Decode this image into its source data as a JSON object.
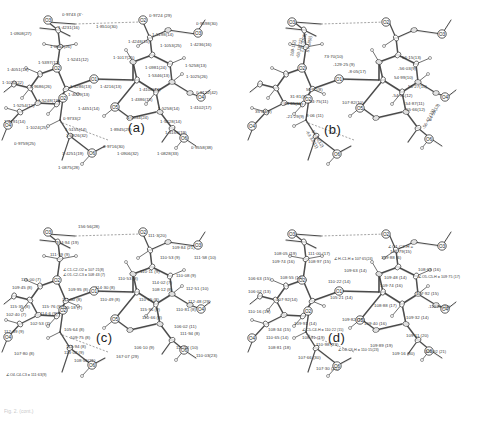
{
  "figure": {
    "type": "crystallographic-ortep-panels",
    "panel_count": 4,
    "background_color": "#ffffff",
    "line_color": "#2b2b2b",
    "caption_fragment": "Fig. 2. (cont.)"
  },
  "panels": [
    {
      "id": "a",
      "letter": "(a)",
      "quantity": "bond lengths",
      "units": "angstrom",
      "labels": [
        {
          "text": "0·9743 (3'·",
          "x": 62,
          "y": 13
        },
        {
          "text": "1·4231(16)",
          "x": 58,
          "y": 26
        },
        {
          "text": "1·8510(30)",
          "x": 96,
          "y": 25
        },
        {
          "text": "0·9724 (29)",
          "x": 149,
          "y": 14
        },
        {
          "text": "0·9598(30)",
          "x": 196,
          "y": 22
        },
        {
          "text": "1·0908(27)",
          "x": 10,
          "y": 32
        },
        {
          "text": "1·0952(26)",
          "x": 50,
          "y": 45
        },
        {
          "text": "1·5198(14)",
          "x": 152,
          "y": 33
        },
        {
          "text": "1·4248(15)",
          "x": 128,
          "y": 40
        },
        {
          "text": "1·1053(25)",
          "x": 160,
          "y": 44
        },
        {
          "text": "1·4236(16)",
          "x": 190,
          "y": 43
        },
        {
          "text": "1·5241(12)",
          "x": 67,
          "y": 58
        },
        {
          "text": "1·5397(12)",
          "x": 38,
          "y": 61
        },
        {
          "text": "1·1017(25)",
          "x": 113,
          "y": 56
        },
        {
          "text": "1·4051(14)",
          "x": 7,
          "y": 68
        },
        {
          "text": "1·0981(24)",
          "x": 145,
          "y": 66
        },
        {
          "text": "1·5258(13)",
          "x": 185,
          "y": 64
        },
        {
          "text": "1·4286(13)",
          "x": 70,
          "y": 85
        },
        {
          "text": "1·4216(13)",
          "x": 100,
          "y": 85
        },
        {
          "text": "1·5346(13)",
          "x": 148,
          "y": 74
        },
        {
          "text": "1·1025(26)",
          "x": 186,
          "y": 75
        },
        {
          "text": "1·1020(22)",
          "x": 2,
          "y": 81
        },
        {
          "text": "0·9686(26)",
          "x": 30,
          "y": 85
        },
        {
          "text": "1·4079(13)",
          "x": 68,
          "y": 93
        },
        {
          "text": "1·4108(14)",
          "x": 139,
          "y": 88
        },
        {
          "text": "0·9122(42)",
          "x": 196,
          "y": 91
        },
        {
          "text": "1·5248(13)",
          "x": 38,
          "y": 99
        },
        {
          "text": "1·4386(15)",
          "x": 131,
          "y": 98
        },
        {
          "text": "1·4451(14)",
          "x": 78,
          "y": 107
        },
        {
          "text": "1·5258(14)",
          "x": 158,
          "y": 107
        },
        {
          "text": "1·4102(17)",
          "x": 190,
          "y": 106
        },
        {
          "text": "1·5254(12)",
          "x": 13,
          "y": 104
        },
        {
          "text": "0·9733(2",
          "x": 63,
          "y": 117
        },
        {
          "text": "1·1034(24)",
          "x": 127,
          "y": 116
        },
        {
          "text": "1·5228(14)",
          "x": 160,
          "y": 120
        },
        {
          "text": "1·4191(14)",
          "x": 4,
          "y": 120
        },
        {
          "text": "1·1024(25)",
          "x": 26,
          "y": 126
        },
        {
          "text": "1·5155(14)",
          "x": 65,
          "y": 128
        },
        {
          "text": "1·0926(32)",
          "x": 66,
          "y": 134
        },
        {
          "text": "1·8945(29)",
          "x": 110,
          "y": 128
        },
        {
          "text": "1·4169(19)",
          "x": 165,
          "y": 131
        },
        {
          "text": "0·9759(25)",
          "x": 14,
          "y": 142
        },
        {
          "text": "0·9716(30)",
          "x": 103,
          "y": 145
        },
        {
          "text": "0·9558(38)",
          "x": 191,
          "y": 146
        },
        {
          "text": "1·4251(19)",
          "x": 62,
          "y": 152
        },
        {
          "text": "1·0906(32)",
          "x": 117,
          "y": 152
        },
        {
          "text": "1·0828(33)",
          "x": 157,
          "y": 152
        },
        {
          "text": "1·0875(28)",
          "x": 58,
          "y": 166
        }
      ]
    },
    {
      "id": "b",
      "letter": "(b)",
      "quantity": "torsion angles",
      "units": "degrees",
      "labels": [
        {
          "text": "73·70(10)",
          "x": 78,
          "y": 55
        },
        {
          "text": "-129·25 (9)",
          "x": 87,
          "y": 63
        },
        {
          "text": "-8·05(17)",
          "x": 102,
          "y": 70
        },
        {
          "text": "-56·03(9)",
          "x": 152,
          "y": 67
        },
        {
          "text": "56·15(13)",
          "x": 156,
          "y": 56
        },
        {
          "text": "54·99(10)",
          "x": 148,
          "y": 76
        },
        {
          "text": "56·27(10)",
          "x": 162,
          "y": 85
        },
        {
          "text": "59·81(8)",
          "x": 60,
          "y": 88
        },
        {
          "text": "-44·75(11)",
          "x": 62,
          "y": 100
        },
        {
          "text": "107·82(10)",
          "x": 96,
          "y": 101
        },
        {
          "text": "-54·91(12)",
          "x": 146,
          "y": 94
        },
        {
          "text": "-54·87(11)",
          "x": 158,
          "y": 102
        },
        {
          "text": "55·66(12)",
          "x": 160,
          "y": 108
        },
        {
          "text": "31·81(9)",
          "x": 44,
          "y": 95
        },
        {
          "text": "44·65(11)",
          "x": 38,
          "y": 102
        },
        {
          "text": "35·04(9)",
          "x": 9,
          "y": 110
        },
        {
          "text": "-21·29(9)",
          "x": 40,
          "y": 115
        },
        {
          "text": "8·06 (11)",
          "x": 60,
          "y": 114
        },
        {
          "text": "171·37(9)",
          "x": 54,
          "y": 52,
          "rot": -80
        },
        {
          "text": "57·18(8)",
          "x": 60,
          "y": 52,
          "rot": -80
        },
        {
          "text": "169·1(2)",
          "x": 44,
          "y": 56,
          "rot": -80
        },
        {
          "text": "-63·18(12)",
          "x": 50,
          "y": 58,
          "rot": -80
        },
        {
          "text": "64·59(13)",
          "x": 182,
          "y": 120,
          "rot": -62
        },
        {
          "text": "-56·42 (13)",
          "x": 176,
          "y": 128,
          "rot": -62
        },
        {
          "text": "-63·33(11)",
          "x": 62,
          "y": 130,
          "rot": 58
        },
        {
          "text": "57·14(12)",
          "x": 68,
          "y": 130,
          "rot": 58
        }
      ]
    },
    {
      "id": "c",
      "letter": "(c)",
      "quantity": "bond angles, heavy atoms",
      "units": "degrees",
      "labels": [
        {
          "text": "156·56(28)",
          "x": 78,
          "y": 13
        },
        {
          "text": "111·3(20)",
          "x": 148,
          "y": 22
        },
        {
          "text": "104·94 (19)",
          "x": 56,
          "y": 29
        },
        {
          "text": "109·84 (21)",
          "x": 172,
          "y": 34
        },
        {
          "text": "111·19 (9)",
          "x": 50,
          "y": 41
        },
        {
          "text": "110·53 (9)",
          "x": 160,
          "y": 44
        },
        {
          "text": "111·58 (10)",
          "x": 194,
          "y": 44
        },
        {
          "text": "∠C1-C2-O2 = 107·21(8)",
          "x": 63,
          "y": 57
        },
        {
          "text": "∠O1-C2-C3 = 108·43 (7)",
          "x": 63,
          "y": 62
        },
        {
          "text": "110·11 (9)",
          "x": 140,
          "y": 58
        },
        {
          "text": "110·53 (8)",
          "x": 118,
          "y": 65
        },
        {
          "text": "110·08 (9)",
          "x": 176,
          "y": 62
        },
        {
          "text": "114·02 (7)",
          "x": 152,
          "y": 69
        },
        {
          "text": "115·00 (7)",
          "x": 21,
          "y": 66
        },
        {
          "text": "109·45 (8)",
          "x": 12,
          "y": 74
        },
        {
          "text": "114·30 (8)",
          "x": 95,
          "y": 74
        },
        {
          "text": "109·95 (8)",
          "x": 68,
          "y": 76
        },
        {
          "text": "108·12 (8)",
          "x": 152,
          "y": 76
        },
        {
          "text": "112·51 (10)",
          "x": 186,
          "y": 75
        },
        {
          "text": "111·00 (8)",
          "x": 62,
          "y": 86
        },
        {
          "text": "110·49 (8)",
          "x": 100,
          "y": 86
        },
        {
          "text": "110·65 (8)",
          "x": 139,
          "y": 86
        },
        {
          "text": "105·18 (7)",
          "x": 62,
          "y": 94
        },
        {
          "text": "112·48 (29)",
          "x": 188,
          "y": 88
        },
        {
          "text": "115·35 (8)",
          "x": 10,
          "y": 93
        },
        {
          "text": "115·76 (9)",
          "x": 42,
          "y": 93
        },
        {
          "text": "115·96 (9)",
          "x": 140,
          "y": 96
        },
        {
          "text": "110·81 (8)",
          "x": 176,
          "y": 96
        },
        {
          "text": "114·6 (9)",
          "x": 40,
          "y": 100
        },
        {
          "text": "102·40 (7)",
          "x": 6,
          "y": 101
        },
        {
          "text": "110·66 (8)",
          "x": 142,
          "y": 104
        },
        {
          "text": "102·53 (7)",
          "x": 30,
          "y": 110
        },
        {
          "text": "105·64 (8)",
          "x": 64,
          "y": 116
        },
        {
          "text": "106·02 (11)",
          "x": 174,
          "y": 113
        },
        {
          "text": "112·39 (9)",
          "x": 4,
          "y": 118
        },
        {
          "text": "109·75 (8)",
          "x": 70,
          "y": 124
        },
        {
          "text": "111·94 (8)",
          "x": 180,
          "y": 120
        },
        {
          "text": "114·94 (8)",
          "x": 66,
          "y": 133
        },
        {
          "text": "113·02 (9)",
          "x": 64,
          "y": 139
        },
        {
          "text": "106·10 (9)",
          "x": 134,
          "y": 134
        },
        {
          "text": "111·52 (10)",
          "x": 176,
          "y": 134
        },
        {
          "text": "107·80 (8)",
          "x": 14,
          "y": 140
        },
        {
          "text": "167·07 (29)",
          "x": 116,
          "y": 143
        },
        {
          "text": "110·03(23)",
          "x": 196,
          "y": 142
        },
        {
          "text": "108·56(21)",
          "x": 74,
          "y": 147
        },
        {
          "text": "∠O4-C4-C3 = 111·63(9)",
          "x": 6,
          "y": 162
        }
      ]
    },
    {
      "id": "d",
      "letter": "(d)",
      "quantity": "bond angles involving H",
      "units": "degrees",
      "labels": [
        {
          "text": "∠C1-C2-H =",
          "x": 142,
          "y": 33
        },
        {
          "text": "106·79(15)",
          "x": 144,
          "y": 38
        },
        {
          "text": "108·05 (19)",
          "x": 28,
          "y": 40
        },
        {
          "text": "111·00 (17)",
          "x": 62,
          "y": 40
        },
        {
          "text": "109·88 (6)",
          "x": 135,
          "y": 44
        },
        {
          "text": "109·74 (16)",
          "x": 26,
          "y": 48
        },
        {
          "text": "108·97 (15)",
          "x": 62,
          "y": 48
        },
        {
          "text": "∠H-C1-H = 107·65(24)",
          "x": 88,
          "y": 46
        },
        {
          "text": "109·63 (14)",
          "x": 98,
          "y": 57
        },
        {
          "text": "108·63 (16)",
          "x": 172,
          "y": 56
        },
        {
          "text": "106·63 (15)",
          "x": 2,
          "y": 65
        },
        {
          "text": "108·55 (14)",
          "x": 34,
          "y": 64
        },
        {
          "text": "109·48 (14)",
          "x": 138,
          "y": 64
        },
        {
          "text": "∠O5-C5-H = 109·75 (17)",
          "x": 172,
          "y": 64
        },
        {
          "text": "110·22 (14)",
          "x": 82,
          "y": 68
        },
        {
          "text": "109·74 (16)",
          "x": 134,
          "y": 72
        },
        {
          "text": "106·02 (13)",
          "x": 2,
          "y": 78
        },
        {
          "text": "107·92 (15)",
          "x": 170,
          "y": 80
        },
        {
          "text": "105·21 (14)",
          "x": 84,
          "y": 84
        },
        {
          "text": "107·92(14)",
          "x": 30,
          "y": 86
        },
        {
          "text": "108·88 (17)",
          "x": 128,
          "y": 92
        },
        {
          "text": "-110·23 (18)",
          "x": 182,
          "y": 93
        },
        {
          "text": "110·16 (16)",
          "x": 2,
          "y": 98
        },
        {
          "text": "109·82 (17)",
          "x": 96,
          "y": 106
        },
        {
          "text": "109·32 (14)",
          "x": 160,
          "y": 104
        },
        {
          "text": "109·91 (14)",
          "x": 48,
          "y": 110
        },
        {
          "text": "∠C5-C4-H = 110·22 (15)",
          "x": 56,
          "y": 117
        },
        {
          "text": "109·40 (16)",
          "x": 118,
          "y": 110
        },
        {
          "text": "108·34 (15)",
          "x": 22,
          "y": 116
        },
        {
          "text": "110·65 (14)",
          "x": 20,
          "y": 124
        },
        {
          "text": "108·91 (19)",
          "x": 56,
          "y": 124
        },
        {
          "text": "109·11 (20)",
          "x": 160,
          "y": 122
        },
        {
          "text": "110·98 (23)",
          "x": 70,
          "y": 131
        },
        {
          "text": "109·89 (19)",
          "x": 124,
          "y": 132
        },
        {
          "text": "108·81 (18)",
          "x": 22,
          "y": 134
        },
        {
          "text": "∠O6-C6-H = 110·15(23)",
          "x": 92,
          "y": 137
        },
        {
          "text": "109·16 (30)",
          "x": 146,
          "y": 140
        },
        {
          "text": "-107·92 (21)",
          "x": 178,
          "y": 138
        },
        {
          "text": "107·66 (30)",
          "x": 52,
          "y": 144
        },
        {
          "text": "107·30 (21)",
          "x": 70,
          "y": 155
        }
      ]
    }
  ],
  "atoms": {
    "panel_a": [
      {
        "label": "O3",
        "x": 48,
        "y": 20
      },
      {
        "label": "O2",
        "x": 143,
        "y": 20
      },
      {
        "label": "O3",
        "x": 198,
        "y": 33
      },
      {
        "label": "O1",
        "x": 94,
        "y": 79
      },
      {
        "label": "O2",
        "x": 57,
        "y": 68
      },
      {
        "label": "O2",
        "x": 63,
        "y": 98
      },
      {
        "label": "O4",
        "x": 201,
        "y": 97
      },
      {
        "label": "O4",
        "x": 8,
        "y": 125
      },
      {
        "label": "O5",
        "x": 115,
        "y": 107
      },
      {
        "label": "O6",
        "x": 184,
        "y": 138
      },
      {
        "label": "O6",
        "x": 92,
        "y": 153
      }
    ],
    "panel_b": [
      {
        "label": "O3",
        "x": 46,
        "y": 22
      },
      {
        "label": "O2",
        "x": 140,
        "y": 22
      },
      {
        "label": "O3",
        "x": 196,
        "y": 34
      },
      {
        "label": "O1",
        "x": 93,
        "y": 79
      },
      {
        "label": "O2",
        "x": 56,
        "y": 68
      },
      {
        "label": "O2",
        "x": 62,
        "y": 99
      },
      {
        "label": "O4",
        "x": 199,
        "y": 97
      },
      {
        "label": "O4",
        "x": 6,
        "y": 126
      },
      {
        "label": "O5",
        "x": 114,
        "y": 108
      },
      {
        "label": "O6",
        "x": 183,
        "y": 139
      },
      {
        "label": "O6",
        "x": 91,
        "y": 154
      }
    ],
    "panel_c": [
      {
        "label": "O3",
        "x": 48,
        "y": 20
      },
      {
        "label": "O2",
        "x": 143,
        "y": 20
      },
      {
        "label": "O3",
        "x": 198,
        "y": 33
      },
      {
        "label": "O1",
        "x": 94,
        "y": 79
      },
      {
        "label": "O2",
        "x": 57,
        "y": 68
      },
      {
        "label": "O2",
        "x": 63,
        "y": 98
      },
      {
        "label": "O4",
        "x": 201,
        "y": 97
      },
      {
        "label": "O4",
        "x": 8,
        "y": 125
      },
      {
        "label": "O5",
        "x": 115,
        "y": 107
      },
      {
        "label": "O6",
        "x": 184,
        "y": 138
      },
      {
        "label": "O6",
        "x": 92,
        "y": 153
      }
    ],
    "panel_d": [
      {
        "label": "O3",
        "x": 46,
        "y": 22
      },
      {
        "label": "O2",
        "x": 140,
        "y": 22
      },
      {
        "label": "O3",
        "x": 196,
        "y": 34
      },
      {
        "label": "O1",
        "x": 93,
        "y": 79
      },
      {
        "label": "O2",
        "x": 56,
        "y": 68
      },
      {
        "label": "O2",
        "x": 62,
        "y": 99
      },
      {
        "label": "O4",
        "x": 199,
        "y": 97
      },
      {
        "label": "O4",
        "x": 6,
        "y": 126
      },
      {
        "label": "O5",
        "x": 114,
        "y": 108
      },
      {
        "label": "O6",
        "x": 183,
        "y": 139
      },
      {
        "label": "O6",
        "x": 91,
        "y": 154
      }
    ]
  }
}
